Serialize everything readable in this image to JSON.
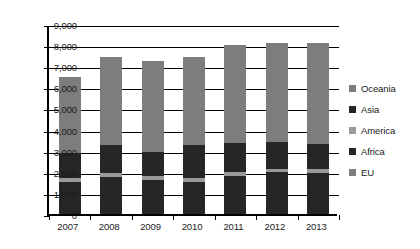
{
  "chart_data": {
    "type": "bar",
    "stacked": true,
    "title": "",
    "xlabel": "",
    "ylabel": "",
    "ylim": [
      0,
      9000
    ],
    "ytick_step": 1000,
    "ytick_labels": [
      "9,000",
      "8,000",
      "7,000",
      "6,000",
      "5,000",
      "4,000",
      "3,000",
      "2,000",
      "1,000",
      "0"
    ],
    "ytick_values": [
      9000,
      8000,
      7000,
      6000,
      5000,
      4000,
      3000,
      2000,
      1000,
      0
    ],
    "grid": true,
    "grid_axis": "y",
    "legend_position": "right",
    "categories": [
      "2007",
      "2008",
      "2009",
      "2010",
      "2011",
      "2012",
      "2013"
    ],
    "series": [
      {
        "name": "EU",
        "color": "#262626",
        "values": [
          1500,
          1750,
          1600,
          1500,
          1800,
          2000,
          1950
        ]
      },
      {
        "name": "Africa",
        "color": "#9a9a9a",
        "values": [
          200,
          200,
          200,
          200,
          200,
          150,
          200
        ]
      },
      {
        "name": "America",
        "color": "#262626",
        "values": [
          1200,
          1300,
          1150,
          1550,
          1380,
          1250,
          1150
        ]
      },
      {
        "name": "Asia",
        "color": "#262626",
        "values": [
          0,
          0,
          0,
          0,
          0,
          0,
          0
        ]
      },
      {
        "name": "Oceania",
        "color": "#7d7d7d",
        "values": [
          3600,
          4200,
          4300,
          4180,
          4620,
          4720,
          4820
        ]
      }
    ],
    "totals": [
      6500,
      7450,
      7250,
      7430,
      8000,
      8120,
      8120
    ],
    "legend_entries": [
      {
        "label": "Oceania",
        "color": "#7d7d7d"
      },
      {
        "label": "Asia",
        "color": "#262626"
      },
      {
        "label": "America",
        "color": "#9a9a9a"
      },
      {
        "label": "Africa",
        "color": "#262626"
      },
      {
        "label": "EU",
        "color": "#7d7d7d"
      }
    ]
  }
}
